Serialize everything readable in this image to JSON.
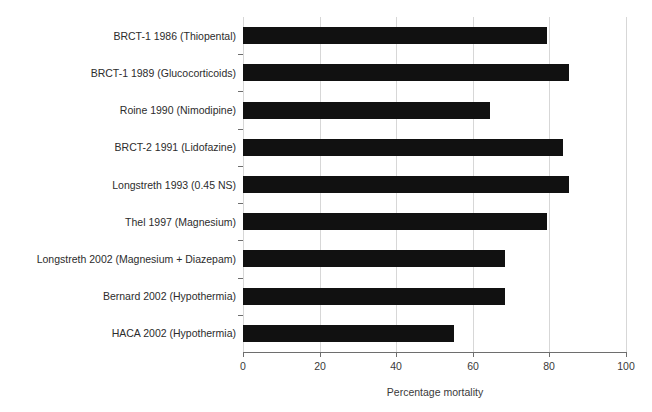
{
  "chart_data": {
    "type": "bar",
    "orientation": "horizontal",
    "title": "",
    "subtitle": "",
    "xlabel": "Percentage mortality",
    "ylabel": "",
    "xlim": [
      0,
      100
    ],
    "xticks": [
      0,
      20,
      40,
      60,
      80,
      100
    ],
    "xticklabels": [
      "0",
      "20",
      "40",
      "60",
      "80",
      "100"
    ],
    "grid": true,
    "grid_axis": "x",
    "legend": false,
    "legend_position": "none",
    "bar_color": "#111111",
    "categories": [
      "BRCT-1 1986 (Thiopental)",
      "BRCT-1 1989 (Glucocorticoids)",
      "Roine 1990 (Nimodipine)",
      "BRCT-2 1991 (Lidofazine)",
      "Longstreth 1993 (0.45 NS)",
      "Thel 1997 (Magnesium)",
      "Longstreth 2002 (Magnesium + Diazepam)",
      "Bernard 2002 (Hypothermia)",
      "HACA 2002 (Hypothermia)"
    ],
    "values": [
      79.5,
      85,
      64.5,
      83.5,
      85,
      79.5,
      68.5,
      68.5,
      55
    ],
    "series": [
      {
        "name": "Percentage mortality",
        "values": [
          79.5,
          85,
          64.5,
          83.5,
          85,
          79.5,
          68.5,
          68.5,
          55
        ]
      }
    ]
  },
  "axis": {
    "x_title": "Percentage mortality"
  }
}
